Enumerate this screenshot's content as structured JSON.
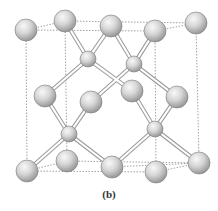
{
  "caption": "(b)",
  "colors": {
    "background": "#ffffff",
    "atom_light": "#f4f4f4",
    "atom_mid": "#cfcfcf",
    "atom_dark": "#8c8c8c",
    "bond_outline": "#9a9a9a",
    "bond_fill": "#ffffff",
    "cube_edge": "#8a8a8a"
  },
  "structure": "diamond cubic unit cell",
  "atoms": {
    "large": [
      {
        "id": "top-front-left",
        "x": 26,
        "y": 30
      },
      {
        "id": "top-back-left",
        "x": 65,
        "y": 21
      },
      {
        "id": "top-middle",
        "x": 111,
        "y": 26
      },
      {
        "id": "top-front-right",
        "x": 155,
        "y": 31
      },
      {
        "id": "top-back-right",
        "x": 196,
        "y": 23
      },
      {
        "id": "mid-left",
        "x": 45,
        "y": 96
      },
      {
        "id": "mid-center",
        "x": 91,
        "y": 102
      },
      {
        "id": "mid-right-center",
        "x": 132,
        "y": 91
      },
      {
        "id": "mid-right",
        "x": 177,
        "y": 97
      },
      {
        "id": "bottom-front-left",
        "x": 27,
        "y": 171
      },
      {
        "id": "bottom-back-left",
        "x": 67,
        "y": 161
      },
      {
        "id": "bottom-middle",
        "x": 112,
        "y": 167
      },
      {
        "id": "bottom-front-right",
        "x": 156,
        "y": 172
      },
      {
        "id": "bottom-back-right",
        "x": 199,
        "y": 163
      }
    ],
    "small": [
      {
        "id": "interior-1",
        "x": 88,
        "y": 59
      },
      {
        "id": "interior-2",
        "x": 134,
        "y": 64
      },
      {
        "id": "interior-3",
        "x": 69,
        "y": 134
      },
      {
        "id": "interior-4",
        "x": 155,
        "y": 129
      }
    ]
  }
}
